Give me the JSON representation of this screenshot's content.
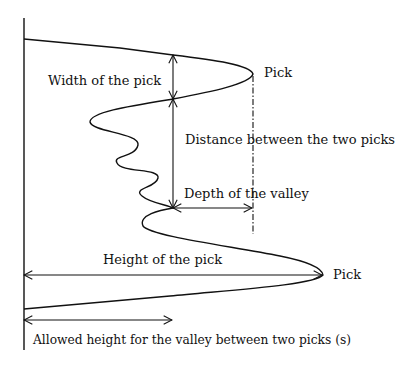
{
  "diagram": {
    "labels": {
      "pick_top": "Pick",
      "pick_bottom": "Pick",
      "width_of_pick": "Width of the pick",
      "distance_between_picks": "Distance between the two picks",
      "depth_of_valley": "Depth of the valley",
      "height_of_pick": "Height of the pick",
      "allowed_height": "Allowed height for the valley between two picks (s)"
    },
    "colors": {
      "line": "#111111",
      "background": "#ffffff"
    }
  }
}
